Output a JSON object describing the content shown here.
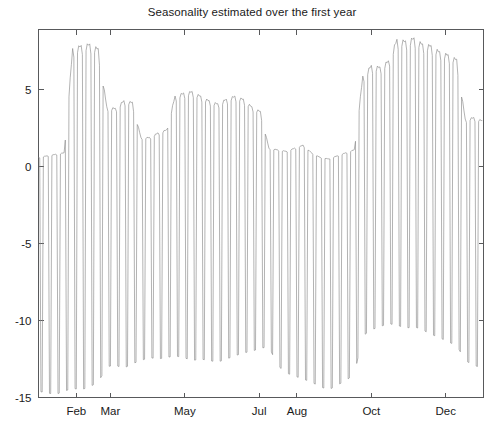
{
  "chart_data": {
    "type": "line",
    "title": "Seasonality estimated over the first year",
    "xlabel": "",
    "ylabel": "",
    "xlim": [
      0,
      365
    ],
    "ylim": [
      -15,
      8.9
    ],
    "grid": false,
    "legend": null,
    "line_color": "#8a8a8a",
    "axis_color": "#58595b",
    "background": "#ffffff",
    "y_ticks": [
      5,
      0,
      -5,
      -10,
      -15
    ],
    "y_tick_labels": [
      "5",
      "0",
      "-5",
      "-10",
      "-15"
    ],
    "x_ticks": [
      31,
      59,
      120,
      181,
      212,
      273,
      334
    ],
    "x_tick_labels": [
      "Feb",
      "Mar",
      "May",
      "Jul",
      "Aug",
      "Oct",
      "Dec"
    ],
    "series": [
      {
        "name": "seasonality",
        "x": [
          0,
          1,
          2,
          3,
          4,
          5,
          6,
          7,
          8,
          9,
          10,
          11,
          12,
          13,
          14,
          15,
          16,
          17,
          18,
          19,
          20,
          21,
          22,
          23,
          24,
          25,
          26,
          27,
          28,
          29,
          30,
          31,
          32,
          33,
          34,
          35,
          36,
          37,
          38,
          39,
          40,
          41,
          42,
          43,
          44,
          45,
          46,
          47,
          48,
          49,
          50,
          51,
          52,
          53,
          54,
          55,
          56,
          57,
          58,
          59,
          60,
          61,
          62,
          63,
          64,
          65,
          66,
          67,
          68,
          69,
          70,
          71,
          72,
          73,
          74,
          75,
          76,
          77,
          78,
          79,
          80,
          81,
          82,
          83,
          84,
          85,
          86,
          87,
          88,
          89,
          90,
          91,
          92,
          93,
          94,
          95,
          96,
          97,
          98,
          99,
          100,
          101,
          102,
          103,
          104,
          105,
          106,
          107,
          108,
          109,
          110,
          111,
          112,
          113,
          114,
          115,
          116,
          117,
          118,
          119,
          120,
          121,
          122,
          123,
          124,
          125,
          126,
          127,
          128,
          129,
          130,
          131,
          132,
          133,
          134,
          135,
          136,
          137,
          138,
          139,
          140,
          141,
          142,
          143,
          144,
          145,
          146,
          147,
          148,
          149,
          150,
          151,
          152,
          153,
          154,
          155,
          156,
          157,
          158,
          159,
          160,
          161,
          162,
          163,
          164,
          165,
          166,
          167,
          168,
          169,
          170,
          171,
          172,
          173,
          174,
          175,
          176,
          177,
          178,
          179,
          180,
          181,
          182,
          183,
          184,
          185,
          186,
          187,
          188,
          189,
          190,
          191,
          192,
          193,
          194,
          195,
          196,
          197,
          198,
          199,
          200,
          201,
          202,
          203,
          204,
          205,
          206,
          207,
          208,
          209,
          210,
          211,
          212,
          213,
          214,
          215,
          216,
          217,
          218,
          219,
          220,
          221,
          222,
          223,
          224,
          225,
          226,
          227,
          228,
          229,
          230,
          231,
          232,
          233,
          234,
          235,
          236,
          237,
          238,
          239,
          240,
          241,
          242,
          243,
          244,
          245,
          246,
          247,
          248,
          249,
          250,
          251,
          252,
          253,
          254,
          255,
          256,
          257,
          258,
          259,
          260,
          261,
          262,
          263,
          264,
          265,
          266,
          267,
          268,
          269,
          270,
          271,
          272,
          273,
          274,
          275,
          276,
          277,
          278,
          279,
          280,
          281,
          282,
          283,
          284,
          285,
          286,
          287,
          288,
          289,
          290,
          291,
          292,
          293,
          294,
          295,
          296,
          297,
          298,
          299,
          300,
          301,
          302,
          303,
          304,
          305,
          306,
          307,
          308,
          309,
          310,
          311,
          312,
          313,
          314,
          315,
          316,
          317,
          318,
          319,
          320,
          321,
          322,
          323,
          324,
          325,
          326,
          327,
          328,
          329,
          330,
          331,
          332,
          333,
          334,
          335,
          336,
          337,
          338,
          339,
          340,
          341,
          342,
          343,
          344,
          345,
          346,
          347,
          348,
          349,
          350,
          351,
          352,
          353,
          354,
          355,
          356,
          357,
          358,
          359,
          360,
          361,
          362,
          363,
          364
        ],
        "weekly_envelope_peak": [
          0.6,
          0.7,
          0.8,
          0.9,
          7.7,
          7.9,
          8.0,
          7.7,
          3.9,
          3.8,
          4.3,
          4.2,
          1.9,
          1.9,
          2.2,
          2.4,
          4.6,
          4.8,
          4.9,
          4.6,
          4.3,
          4.1,
          4.4,
          4.6,
          4.4,
          3.9,
          3.6,
          1.2,
          1.1,
          1.0,
          1.2,
          1.4,
          0.9,
          0.6,
          0.5,
          0.7,
          0.9,
          1.1,
          5.9,
          6.6,
          6.5,
          6.9,
          8.3,
          8.2,
          8.4,
          8.0,
          7.9,
          7.5,
          7.3,
          7.0,
          3.1,
          3.2,
          3.0,
          2.6,
          2.2
        ],
        "weekly_envelope_trough": [
          -14.6,
          -14.7,
          -14.8,
          -14.6,
          -14.4,
          -14.5,
          -14.3,
          -14.0,
          -13.0,
          -12.9,
          -13.1,
          -12.8,
          -12.6,
          -12.4,
          -12.5,
          -12.4,
          -12.3,
          -12.4,
          -12.6,
          -12.5,
          -12.6,
          -12.7,
          -12.5,
          -12.3,
          -12.1,
          -12.0,
          -11.8,
          -11.7,
          -12.9,
          -13.4,
          -13.6,
          -13.8,
          -14.0,
          -14.3,
          -14.5,
          -14.2,
          -13.9,
          -13.5,
          -11.0,
          -10.6,
          -10.4,
          -10.2,
          -10.3,
          -10.5,
          -10.4,
          -10.6,
          -10.9,
          -11.1,
          -11.4,
          -11.6,
          -12.6,
          -12.9,
          -13.1,
          -12.7,
          -12.4
        ]
      }
    ]
  },
  "axes": {
    "frame": "box",
    "tick_direction": "in"
  }
}
